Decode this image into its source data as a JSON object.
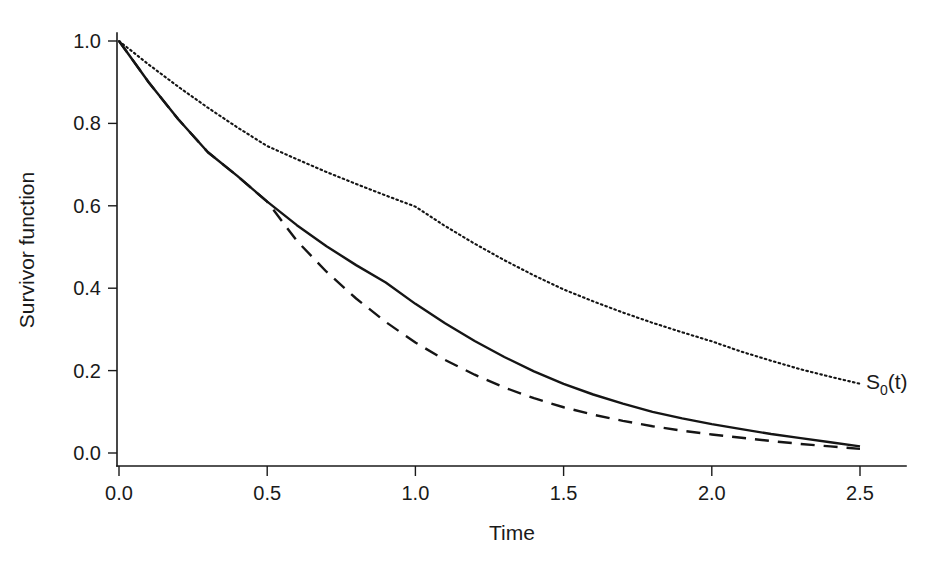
{
  "figure": {
    "width": 951,
    "height": 569,
    "background": "#ffffff",
    "ink_color": "#1a1a1a"
  },
  "chart_data": {
    "type": "line",
    "title": "",
    "xlabel": "Time",
    "ylabel": "Survivor function",
    "xlim": [
      0.0,
      2.72
    ],
    "ylim": [
      0.0,
      1.04
    ],
    "xticks": [
      0.0,
      0.5,
      1.0,
      1.5,
      2.0,
      2.5
    ],
    "xtick_labels": [
      "0.0",
      "0.5",
      "1.0",
      "1.5",
      "2.0",
      "2.5"
    ],
    "yticks": [
      0.0,
      0.2,
      0.4,
      0.6,
      0.8,
      1.0
    ],
    "ytick_labels": [
      "0.0",
      "0.2",
      "0.4",
      "0.6",
      "0.8",
      "1.0"
    ],
    "grid": false,
    "legend": "none",
    "annotations": [
      {
        "name": "baseline-survivor-label",
        "text": "S0(t)",
        "text_main": "S",
        "text_sub": "0",
        "text_tail": "(t)",
        "x": 2.52,
        "y": 0.155
      }
    ],
    "series": [
      {
        "name": "baseline",
        "label": "S0(t)",
        "style": "dotted",
        "x": [
          0.0,
          0.1,
          0.2,
          0.3,
          0.4,
          0.5,
          0.6,
          0.7,
          0.8,
          0.9,
          1.0,
          1.1,
          1.2,
          1.3,
          1.4,
          1.5,
          1.6,
          1.7,
          1.8,
          1.9,
          2.0,
          2.1,
          2.2,
          2.3,
          2.4,
          2.5
        ],
        "y": [
          1.0,
          0.943,
          0.889,
          0.838,
          0.79,
          0.745,
          0.713,
          0.682,
          0.653,
          0.625,
          0.598,
          0.551,
          0.508,
          0.468,
          0.431,
          0.397,
          0.368,
          0.341,
          0.316,
          0.293,
          0.271,
          0.246,
          0.224,
          0.203,
          0.185,
          0.168
        ]
      },
      {
        "name": "treated-solid",
        "label": "",
        "style": "solid",
        "x": [
          0.0,
          0.1,
          0.2,
          0.3,
          0.4,
          0.5,
          0.6,
          0.7,
          0.8,
          0.9,
          1.0,
          1.1,
          1.2,
          1.3,
          1.4,
          1.5,
          1.6,
          1.7,
          1.8,
          1.9,
          2.0,
          2.1,
          2.2,
          2.3,
          2.4,
          2.5
        ],
        "y": [
          1.0,
          0.9,
          0.81,
          0.73,
          0.672,
          0.61,
          0.553,
          0.502,
          0.456,
          0.414,
          0.362,
          0.315,
          0.272,
          0.233,
          0.198,
          0.168,
          0.142,
          0.12,
          0.1,
          0.084,
          0.07,
          0.058,
          0.046,
          0.036,
          0.026,
          0.016
        ]
      },
      {
        "name": "treated-dashed",
        "label": "",
        "style": "dashed",
        "x": [
          0.0,
          0.1,
          0.2,
          0.3,
          0.4,
          0.5,
          0.6,
          0.7,
          0.8,
          0.9,
          1.0,
          1.1,
          1.2,
          1.3,
          1.4,
          1.5,
          1.6,
          1.7,
          1.8,
          1.9,
          2.0,
          2.1,
          2.2,
          2.3,
          2.4,
          2.5
        ],
        "y": [
          1.0,
          0.9,
          0.81,
          0.73,
          0.672,
          0.61,
          0.515,
          0.44,
          0.375,
          0.318,
          0.268,
          0.226,
          0.19,
          0.159,
          0.133,
          0.111,
          0.093,
          0.078,
          0.065,
          0.054,
          0.045,
          0.037,
          0.029,
          0.022,
          0.016,
          0.01
        ]
      }
    ]
  }
}
